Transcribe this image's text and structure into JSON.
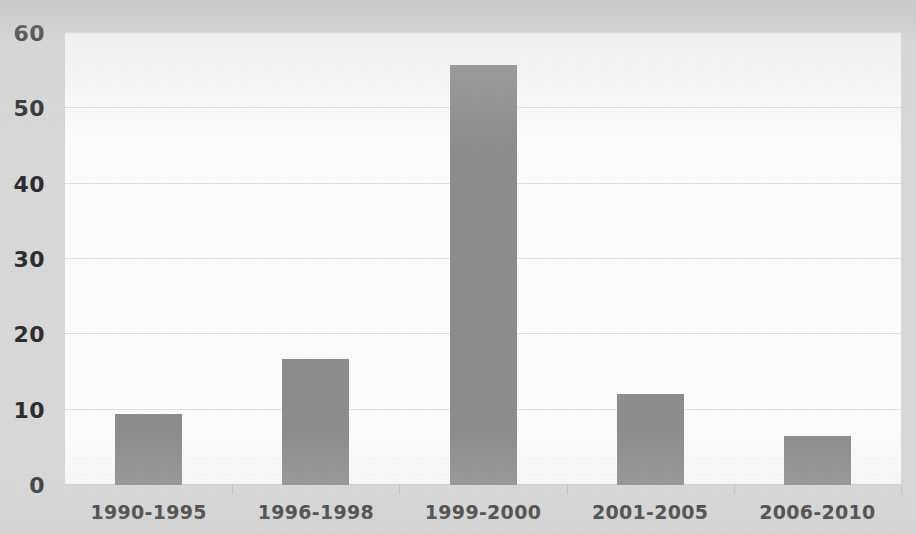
{
  "chart_data": {
    "type": "bar",
    "title": "",
    "subtitle": "",
    "xlabel": "",
    "ylabel": "",
    "categories": [
      "1990-1995",
      "1996-1998",
      "1999-2000",
      "2001-2005",
      "2006-2010"
    ],
    "values": [
      9.4,
      16.7,
      55.8,
      12.1,
      6.5
    ],
    "series": [
      {
        "name": "",
        "values": [
          9.4,
          16.7,
          55.8,
          12.1,
          6.5
        ]
      }
    ],
    "ylim": [
      0,
      60
    ],
    "yticks": [
      0,
      10,
      20,
      30,
      40,
      50,
      60
    ],
    "ytick_labels": [
      "0",
      "10",
      "20",
      "30",
      "40",
      "50",
      "60"
    ],
    "grid": true,
    "grid_axis": "y",
    "legend": false,
    "legend_position": "none",
    "annotations": [],
    "colors": {
      "bar_fill": "#8d8d8d",
      "plot_background": "#fdfdfd",
      "figure_background": "#d9d9d9",
      "gridline": "#e3e3e3",
      "axis_line": "#cfcfcf",
      "tick_label": "#2d2d2d"
    }
  }
}
